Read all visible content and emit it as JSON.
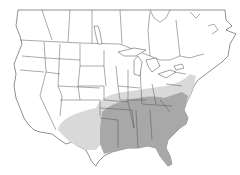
{
  "map": {
    "type": "range-map",
    "region": "North America (United States and southern Canada)",
    "colors": {
      "background": "#ffffff",
      "land": "#ffffff",
      "borders": "#555555",
      "range_light": "#d9d9d9",
      "range_dark": "#a8a8a8"
    },
    "legend": []
  }
}
